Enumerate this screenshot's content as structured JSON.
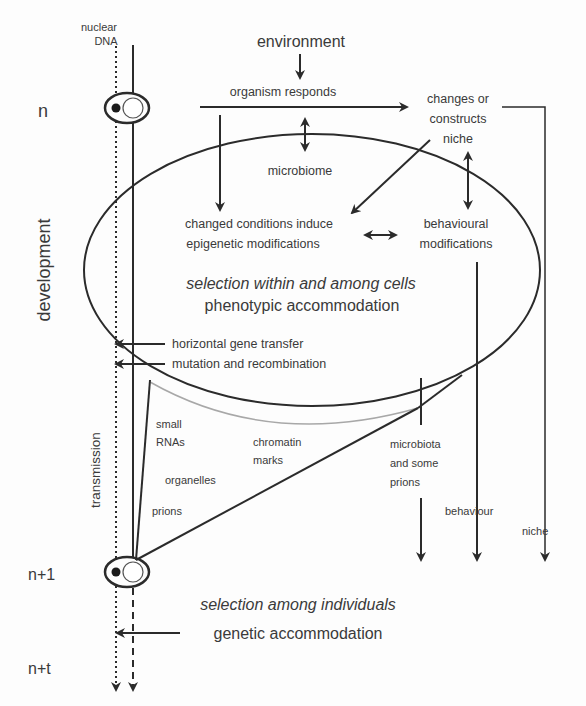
{
  "diagram": {
    "left_axis": {
      "generation_n": "n",
      "generation_n1": "n+1",
      "generation_nt": "n+t",
      "development_label": "development",
      "transmission_label": "transmission"
    },
    "nuclear_dna_label_line1": "nuclear",
    "nuclear_dna_label_line2": "DNA",
    "top": {
      "environment": "environment",
      "organism_responds": "organism responds",
      "niche_line1": "changes or",
      "niche_line2": "constructs",
      "niche_line3": "niche",
      "microbiome": "microbiome"
    },
    "ellipse": {
      "epigenetic_line1": "changed conditions induce",
      "epigenetic_line2": "epigenetic modifications",
      "behavioural_line1": "behavioural",
      "behavioural_line2": "modifications",
      "selection_cells": "selection within and among cells",
      "phenotypic": "phenotypic accommodation",
      "hgt": "horizontal gene transfer",
      "mutation": "mutation and recombination"
    },
    "transmission_items": {
      "small_rnas_line1": "small",
      "small_rnas_line2": "RNAs",
      "chromatin_line1": "chromatin",
      "chromatin_line2": "marks",
      "organelles": "organelles",
      "prions": "prions",
      "microbiota_line1": "microbiota",
      "microbiota_line2": "and some",
      "microbiota_line3": "prions",
      "behaviour": "behaviour",
      "niche": "niche"
    },
    "bottom": {
      "selection_individuals": "selection among individuals",
      "genetic_accommodation": "genetic accommodation"
    },
    "colors": {
      "line": "#2b2b2b",
      "text": "#3a3a3a",
      "grey_curve": "#a8a8a8",
      "background": "#fdfdfd"
    }
  }
}
